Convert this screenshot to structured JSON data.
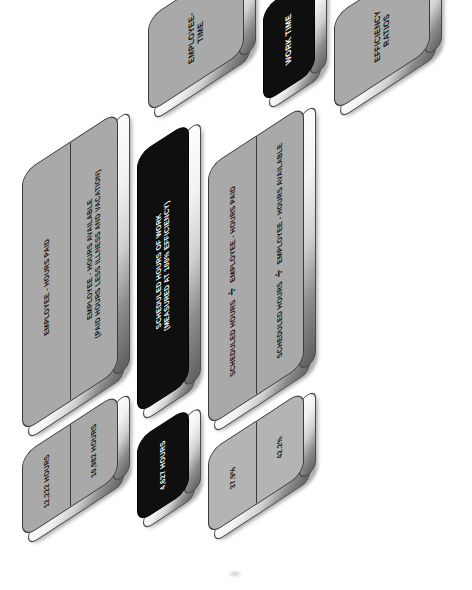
{
  "diagram": {
    "colors": {
      "gray_block": "#a9a9a9",
      "light_gray_block": "#b4b4b4",
      "black_block": "#100f10",
      "outline": "#3a3a3a",
      "bevel_highlight": "#ffffff"
    },
    "division_symbol": "÷",
    "headers": [
      {
        "id": "employee-time",
        "label": "EMPLOYEE-\nTIME",
        "line1": "EMPLOYEE-",
        "line2": "TIME",
        "style": "gray"
      },
      {
        "id": "work-time",
        "label": "WORK TIME",
        "line1": "WORK TIME",
        "line2": "",
        "style": "black"
      },
      {
        "id": "efficiency-ratios",
        "label": "EFFICIENCY\nRATIOS",
        "line1": "EFFICIENCY",
        "line2": "RATIOS",
        "style": "gray"
      }
    ],
    "definitions": [
      {
        "id": "employee-hours-paid",
        "style": "gray",
        "line1": "EMPLOYEE - HOURS PAID",
        "line2": ""
      },
      {
        "id": "employee-hours-available",
        "style": "gray",
        "line1": "EMPLOYEE - HOURS AVAILABLE",
        "line2": "(PAID HOURS LESS ILLNESS AND VACATION)"
      },
      {
        "id": "scheduled-hours-of-work",
        "style": "black",
        "line1": "SCHEDULED HOURS OF WORK",
        "line2": "(MEASURED AT 100% EFFICIENCY)"
      },
      {
        "id": "scheduled-hours-div-employee-hours-paid",
        "style": "gray",
        "numerator": "SCHEDULED HOURS",
        "denominator": "EMPLOYEE - HOURS PAID"
      },
      {
        "id": "scheduled-hours-div-employee-hours-available",
        "style": "gray",
        "numerator": "SCHEDULED HOURS",
        "denominator": "EMPLOYEE - HOURS AVAILABLE"
      }
    ],
    "values": [
      {
        "id": "employee-hours-paid-value",
        "style": "gray",
        "value": "12,222 HOURS"
      },
      {
        "id": "employee-hours-available-value",
        "style": "gray",
        "value": "10,982 HOURS"
      },
      {
        "id": "scheduled-hours-value",
        "style": "black",
        "value": "4,627 HOURS"
      },
      {
        "id": "ratio-paid-value",
        "style": "gray",
        "value": "37.9%"
      },
      {
        "id": "ratio-available-value",
        "style": "gray",
        "value": "42.2%"
      }
    ]
  }
}
